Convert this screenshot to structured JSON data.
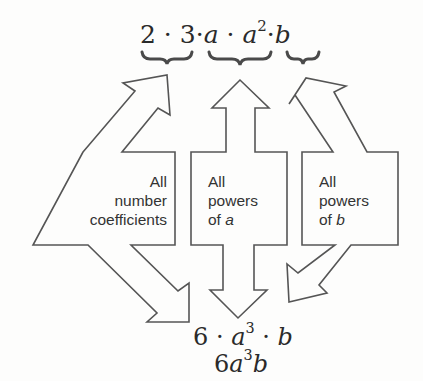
{
  "top_expression": {
    "parts": [
      "2",
      "·",
      "3",
      "·",
      "a",
      "·",
      "a",
      "2",
      "·",
      "b"
    ],
    "text": "2 · 3 · a · a² · b"
  },
  "groups": [
    {
      "id": "coefficients",
      "label_lines": [
        "All",
        "number",
        "coefficients"
      ],
      "brace_over": "2 · 3"
    },
    {
      "id": "powers-a",
      "label_lines": [
        "All",
        "powers",
        "of"
      ],
      "variable": "a",
      "brace_over": "a · a²"
    },
    {
      "id": "powers-b",
      "label_lines": [
        "All",
        "powers",
        "of"
      ],
      "variable": "b",
      "brace_over": "b"
    }
  ],
  "result_expanded": {
    "parts": [
      "6",
      "·",
      "a",
      "3",
      "·",
      "b"
    ],
    "text": "6 · a³ · b"
  },
  "result_simplified": {
    "parts": [
      "6",
      "a",
      "3",
      "b"
    ],
    "text": "6a³b"
  },
  "colors": {
    "stroke": "#555555",
    "brace": "#4a4a4a",
    "background": "#fdfdfc"
  }
}
